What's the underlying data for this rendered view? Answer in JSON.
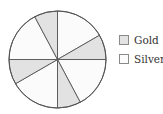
{
  "chart_data": {
    "type": "pie",
    "title": "",
    "series": [
      {
        "name": "Gold",
        "color": "#e2e2e2"
      },
      {
        "name": "Silver",
        "color": "#fbfbfb"
      }
    ],
    "slices": [
      {
        "label": "Silver",
        "start_deg": 0,
        "end_deg": 60
      },
      {
        "label": "Gold",
        "start_deg": 60,
        "end_deg": 90
      },
      {
        "label": "Silver",
        "start_deg": 90,
        "end_deg": 152
      },
      {
        "label": "Gold",
        "start_deg": 152,
        "end_deg": 180
      },
      {
        "label": "Silver",
        "start_deg": 180,
        "end_deg": 240
      },
      {
        "label": "Gold",
        "start_deg": 240,
        "end_deg": 270
      },
      {
        "label": "Silver",
        "start_deg": 270,
        "end_deg": 332
      },
      {
        "label": "Gold",
        "start_deg": 332,
        "end_deg": 360
      }
    ],
    "totals_deg": {
      "Gold": 116,
      "Silver": 244
    },
    "legend_position": "right"
  },
  "legend": {
    "items": [
      {
        "label": "Gold",
        "color": "#e2e2e2"
      },
      {
        "label": "Silver",
        "color": "#fbfbfb"
      }
    ]
  },
  "colors": {
    "stroke": "#555555"
  }
}
